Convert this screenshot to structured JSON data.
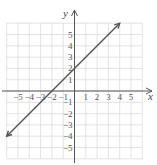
{
  "chart_data": {
    "type": "line",
    "title": "",
    "xlabel": "x",
    "ylabel": "y",
    "xlim": [
      -6,
      6
    ],
    "ylim": [
      -6,
      6
    ],
    "grid": true,
    "x_tick_labels": [
      "−5",
      "−4",
      "−3",
      "−2",
      "−1",
      "1",
      "2",
      "3",
      "4",
      "5"
    ],
    "y_tick_labels": [
      "5",
      "4",
      "3",
      "2",
      "1",
      "−1",
      "−2",
      "−3",
      "−4",
      "−5"
    ],
    "series": [
      {
        "name": "y = x + 2",
        "equation": "y = x + 2",
        "x": [
          -6,
          4
        ],
        "y": [
          -4,
          6
        ],
        "arrows_both_ends": true,
        "color": "#555555"
      }
    ]
  },
  "colors": {
    "grid": "#dcdcdc",
    "axis": "#555555",
    "line": "#555555"
  }
}
